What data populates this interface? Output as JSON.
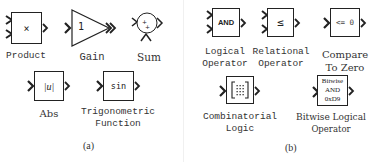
{
  "panels": [
    {
      "caption": "(a)",
      "blocks": [
        {
          "id": "product",
          "glyph": "×",
          "label": "Product",
          "inputs": 2,
          "outputs": 1
        },
        {
          "id": "gain",
          "glyph": "1",
          "label": "Gain",
          "inputs": 1,
          "outputs": 1,
          "shape": "triangle"
        },
        {
          "id": "sum",
          "glyph": "++",
          "label": "Sum",
          "inputs": 2,
          "outputs": 1,
          "shape": "circle"
        },
        {
          "id": "abs",
          "glyph": "|u|",
          "label": "Abs",
          "inputs": 1,
          "outputs": 1
        },
        {
          "id": "trig",
          "glyph": "sin",
          "label_line1": "Trigonometric",
          "label_line2": "Function",
          "inputs": 1,
          "outputs": 1
        }
      ]
    },
    {
      "caption": "(b)",
      "blocks": [
        {
          "id": "logical",
          "glyph": "AND",
          "label_line1": "Logical",
          "label_line2": "Operator",
          "inputs": 2,
          "outputs": 1
        },
        {
          "id": "relational",
          "glyph": "≤",
          "label_line1": "Relational",
          "label_line2": "Operator",
          "inputs": 2,
          "outputs": 1
        },
        {
          "id": "compare",
          "glyph": "<= 0",
          "label_line1": "Compare",
          "label_line2": "To Zero",
          "inputs": 1,
          "outputs": 1
        },
        {
          "id": "combinatorial",
          "glyph": "[⁞⁞⁞]",
          "label_line1": "Combinatorial",
          "label_line2": "Logic",
          "inputs": 1,
          "outputs": 1
        },
        {
          "id": "bitwise",
          "glyph_line1": "Bitwise",
          "glyph_line2": "AND",
          "glyph_line3": "0xD9",
          "label_line1": "Bitwise Logical",
          "label_line2": "Operator",
          "inputs": 1,
          "outputs": 1
        }
      ]
    }
  ]
}
